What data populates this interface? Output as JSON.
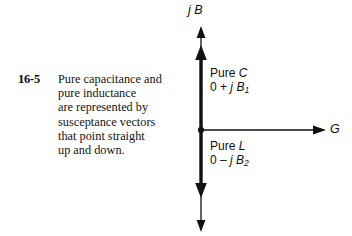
{
  "figure": {
    "number": "16-5",
    "caption_lines": [
      "Pure capacitance and",
      "pure inductance",
      "are represented by",
      "susceptance vectors",
      "that point straight",
      "up and down."
    ]
  },
  "diagram": {
    "type": "vector-diagram",
    "background": "#ffffff",
    "ink_color": "#111111",
    "vertical_axis": {
      "label": "j B",
      "label_italic_parts": [
        "j",
        "B"
      ],
      "meaning": "susceptance axis"
    },
    "horizontal_axis": {
      "label": "G",
      "meaning": "conductance axis"
    },
    "origin_marker": "dot",
    "vectors": [
      {
        "name": "pure-capacitance-vector",
        "direction": "up",
        "title": "Pure C",
        "title_plain": "Pure",
        "title_italic": "C",
        "value": "0 + j B",
        "value_prefix": "0 +",
        "value_symbol": "j B",
        "value_subscript": "1",
        "value_full": "0 + j B1"
      },
      {
        "name": "pure-inductance-vector",
        "direction": "down",
        "title": "Pure L",
        "title_plain": "Pure",
        "title_italic": "L",
        "value": "0 - j B",
        "value_prefix": "0 –",
        "value_symbol": "j B",
        "value_subscript": "2",
        "value_full": "0 – j B2"
      }
    ]
  }
}
